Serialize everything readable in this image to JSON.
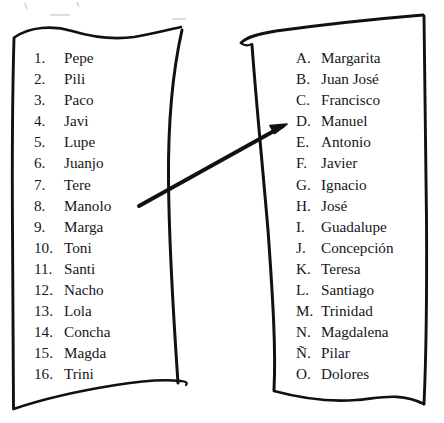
{
  "document": {
    "title": "Two handwritten-boxed name lists with connecting arrow",
    "background_color": "#ffffff",
    "ink_color": "#16151a"
  },
  "left_panel": {
    "name": "numbered-name-list",
    "marker_style": "arabic-numeral",
    "items": [
      {
        "marker": "1.",
        "label": "Pepe"
      },
      {
        "marker": "2.",
        "label": "Pili"
      },
      {
        "marker": "3.",
        "label": "Paco"
      },
      {
        "marker": "4.",
        "label": "Javi"
      },
      {
        "marker": "5.",
        "label": "Lupe"
      },
      {
        "marker": "6.",
        "label": "Juanjo"
      },
      {
        "marker": "7.",
        "label": "Tere"
      },
      {
        "marker": "8.",
        "label": "Manolo"
      },
      {
        "marker": "9.",
        "label": "Marga"
      },
      {
        "marker": "10.",
        "label": "Toni"
      },
      {
        "marker": "11.",
        "label": "Santi"
      },
      {
        "marker": "12.",
        "label": "Nacho"
      },
      {
        "marker": "13.",
        "label": "Lola"
      },
      {
        "marker": "14.",
        "label": "Concha"
      },
      {
        "marker": "15.",
        "label": "Magda"
      },
      {
        "marker": "16.",
        "label": "Trini"
      }
    ]
  },
  "right_panel": {
    "name": "lettered-name-list",
    "marker_style": "spanish-alphabet-letter",
    "items": [
      {
        "marker": "A.",
        "label": "Margarita"
      },
      {
        "marker": "B.",
        "label": "Juan José"
      },
      {
        "marker": "C.",
        "label": "Francisco"
      },
      {
        "marker": "D.",
        "label": "Manuel"
      },
      {
        "marker": "E.",
        "label": "Antonio"
      },
      {
        "marker": "F.",
        "label": "Javier"
      },
      {
        "marker": "G.",
        "label": "Ignacio"
      },
      {
        "marker": "H.",
        "label": "José"
      },
      {
        "marker": "I.",
        "label": "Guadalupe"
      },
      {
        "marker": "J.",
        "label": "Concepción"
      },
      {
        "marker": "K.",
        "label": "Teresa"
      },
      {
        "marker": "L.",
        "label": "Santiago"
      },
      {
        "marker": "M.",
        "label": "Trinidad"
      },
      {
        "marker": "N.",
        "label": "Magdalena"
      },
      {
        "marker": "Ñ.",
        "label": "Pilar"
      },
      {
        "marker": "O.",
        "label": "Dolores"
      }
    ]
  },
  "connector": {
    "name": "manolo-to-manuel-arrow",
    "from_item": "8. Manolo",
    "to_item": "D. Manuel",
    "style": "hand-drawn-straight-arrow"
  }
}
